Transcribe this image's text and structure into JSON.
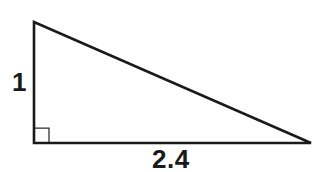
{
  "figure": {
    "kind": "right-triangle-diagram",
    "background_color": "#ffffff",
    "stroke_color": "#1a1a1a",
    "angle_mark_color": "#2b2b2b",
    "canvas": {
      "width": 318,
      "height": 172
    },
    "vertices": {
      "apex": {
        "x": 34,
        "y": 22
      },
      "right_angle": {
        "x": 34,
        "y": 143
      },
      "base_right": {
        "x": 311,
        "y": 143
      }
    },
    "right_angle_marker": {
      "present": true,
      "size": 14,
      "corner": "bottom-left",
      "path": "M 35 128 L 49 128 L 49 142"
    },
    "sides": {
      "vertical_leg": {
        "label": "1",
        "from": "apex",
        "to": "right_angle"
      },
      "horizontal_leg": {
        "label": "2.4",
        "from": "right_angle",
        "to": "base_right"
      },
      "hypotenuse": {
        "label": "",
        "from": "apex",
        "to": "base_right"
      }
    },
    "triangle_path": "M 34 22 L 34 143 L 311 143 Z"
  },
  "labels": {
    "leg_length": "1",
    "base_length": "2.4"
  }
}
